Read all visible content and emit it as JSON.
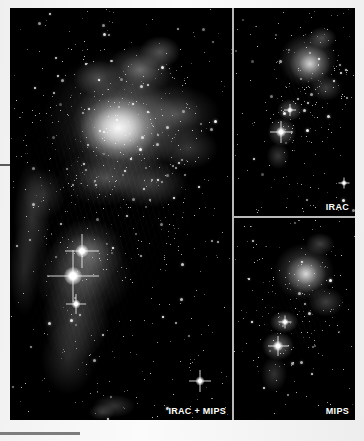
{
  "figure": {
    "kind": "astronomical-image-composite",
    "color_mode": "grayscale",
    "background_color": "#000000",
    "page_background": "#f2f2f2",
    "panels": [
      {
        "id": "main",
        "label": "IRAC + MIPS",
        "label_position": "bottom-right",
        "label_color": "#ffffff",
        "position": "left",
        "description": "Wide-field infrared view of a star-forming nebula with bright central emission core, extended filamentary dust structures and two prominent foreground stars in the lower half"
      },
      {
        "id": "irac",
        "label": "IRAC",
        "label_position": "bottom-right",
        "label_color": "#ffffff",
        "position": "top-right",
        "description": "Zoomed infrared array camera view of the same field showing point sources and the compact nebular knot"
      },
      {
        "id": "mips",
        "label": "MIPS",
        "label_position": "bottom-right",
        "label_color": "#ffffff",
        "position": "bottom-right",
        "description": "Multiband imaging photometer view of the same field emphasising warm dust emission"
      }
    ],
    "divider_color": "#b9b9b9",
    "margin_marks": {
      "left_tick_color": "#5a5a5a",
      "bottom_rule_color": "#7d7d7d"
    }
  }
}
